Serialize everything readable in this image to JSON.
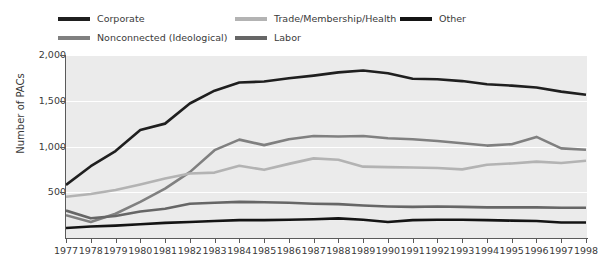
{
  "chart_data": {
    "type": "line",
    "title": "",
    "xlabel": "",
    "ylabel": "Number of PACs",
    "xlim": [
      1977,
      1998
    ],
    "ylim": [
      0,
      2000
    ],
    "yticks": [
      "500",
      "1,000",
      "1,500",
      "2,000"
    ],
    "ytick_values": [
      500,
      1000,
      1500,
      2000
    ],
    "grid": "horizontal",
    "legend_position": "top",
    "x": [
      1977,
      1978,
      1979,
      1980,
      1981,
      1982,
      1983,
      1984,
      1985,
      1986,
      1987,
      1988,
      1989,
      1990,
      1991,
      1992,
      1993,
      1994,
      1995,
      1996,
      1997,
      1998
    ],
    "categories": [
      "1977",
      "1978",
      "1979",
      "1980",
      "1981",
      "1982",
      "1983",
      "1984",
      "1985",
      "1986",
      "1987",
      "1988",
      "1989",
      "1990",
      "1991",
      "1992",
      "1993",
      "1994",
      "1995",
      "1996",
      "1997",
      "1998"
    ],
    "series": [
      {
        "name": "Corporate",
        "color": "#1f1f1f",
        "values": [
          580,
          785,
          950,
          1180,
          1250,
          1470,
          1610,
          1700,
          1710,
          1745,
          1775,
          1810,
          1830,
          1800,
          1740,
          1735,
          1715,
          1680,
          1665,
          1645,
          1600,
          1565
        ]
      },
      {
        "name": "Nonconnected (Ideological)",
        "color": "#808080",
        "values": [
          250,
          175,
          265,
          395,
          540,
          720,
          960,
          1075,
          1015,
          1080,
          1115,
          1110,
          1115,
          1090,
          1080,
          1060,
          1035,
          1010,
          1025,
          1105,
          980,
          965
        ]
      },
      {
        "name": "Trade/Membership/Health",
        "color": "#b3b3b3",
        "values": [
          450,
          480,
          525,
          585,
          650,
          705,
          715,
          790,
          745,
          810,
          870,
          855,
          780,
          775,
          770,
          765,
          750,
          800,
          815,
          835,
          820,
          845
        ]
      },
      {
        "name": "Labor",
        "color": "#666666",
        "values": [
          300,
          215,
          240,
          290,
          320,
          375,
          385,
          395,
          390,
          385,
          375,
          370,
          355,
          345,
          340,
          345,
          340,
          335,
          335,
          335,
          330,
          330
        ]
      },
      {
        "name": "Other",
        "color": "#141414",
        "values": [
          110,
          125,
          135,
          150,
          165,
          175,
          185,
          195,
          195,
          200,
          205,
          215,
          200,
          175,
          195,
          200,
          200,
          195,
          190,
          185,
          170,
          170
        ]
      }
    ]
  },
  "legend": {
    "items": [
      {
        "label": "Corporate",
        "color": "#1f1f1f"
      },
      {
        "label": "Trade/Membership/Health",
        "color": "#b3b3b3"
      },
      {
        "label": "Other",
        "color": "#141414"
      },
      {
        "label": "Nonconnected (Ideological)",
        "color": "#808080"
      },
      {
        "label": "Labor",
        "color": "#666666"
      }
    ]
  },
  "axes": {
    "y_title": "Number of PACs"
  }
}
